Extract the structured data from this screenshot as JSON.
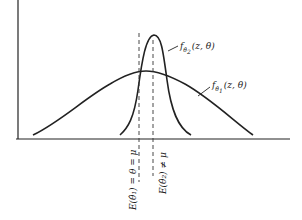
{
  "diagram": {
    "title": "",
    "curves": [
      {
        "name": "f_theta2",
        "label_f": "f",
        "label_sub": "θ̂",
        "label_subsub": "2",
        "label_args": "(z, θ)"
      },
      {
        "name": "f_theta1",
        "label_f": "f",
        "label_sub": "θ̂",
        "label_subsub": "1",
        "label_args": "(z, θ)"
      }
    ],
    "markers": [
      {
        "name": "unbiased-mean",
        "text": "E(θ̂₁) = θ = μ"
      },
      {
        "name": "biased-mean",
        "text": "E(θ̂₂) ≠ μ"
      }
    ],
    "colors": {
      "line": "#222222",
      "background": "#ffffff"
    }
  }
}
